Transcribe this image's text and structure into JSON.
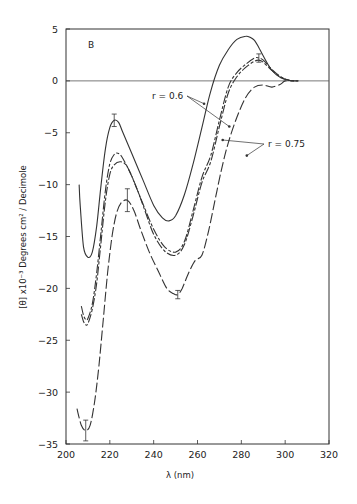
{
  "chart_data": {
    "type": "line",
    "panel_label": "B",
    "title": "",
    "xlabel": "λ (nm)",
    "ylabel": "[θ] x10⁻³ Degrees cm² / Decimole",
    "xlim": [
      200,
      320
    ],
    "ylim": [
      -35,
      5
    ],
    "x_ticks": [
      200,
      220,
      240,
      260,
      280,
      300,
      320
    ],
    "y_ticks": [
      5,
      0,
      -5,
      -10,
      -15,
      -20,
      -25,
      -30,
      -35
    ],
    "grid": false,
    "zero_line": true,
    "annotations": [
      {
        "text": "r = 0.6",
        "points_to": [
          "series_1",
          "series_2"
        ]
      },
      {
        "text": "r = 0.75",
        "points_to": [
          "series_3",
          "series_4"
        ]
      }
    ],
    "series": [
      {
        "name": "series_1",
        "style": "solid",
        "x": [
          206,
          206.5,
          208,
          210,
          212,
          214,
          216,
          218,
          220,
          222,
          224,
          226,
          230,
          235,
          240,
          244,
          247,
          250,
          254,
          258,
          262,
          266,
          270,
          274,
          278,
          282,
          284,
          286,
          288,
          290,
          294,
          298,
          302,
          305
        ],
        "values": [
          -10,
          -12,
          -16,
          -17,
          -16.5,
          -14,
          -10,
          -6.5,
          -4.5,
          -3.8,
          -4,
          -5,
          -7,
          -9.5,
          -12,
          -13.2,
          -13.5,
          -13,
          -11,
          -8,
          -4.5,
          -1,
          1.5,
          3,
          4,
          4.3,
          4.2,
          3.9,
          3.2,
          2.4,
          1,
          0.3,
          0.05,
          0
        ],
        "error_bars": [
          {
            "x": 222,
            "y": -3.8,
            "err": 0.6
          }
        ]
      },
      {
        "name": "series_2",
        "style": "long-short dash",
        "x": [
          207,
          208,
          209,
          210,
          212,
          214,
          216,
          218,
          220,
          222,
          224,
          226,
          230,
          235,
          240,
          245,
          250,
          254,
          258,
          262,
          266,
          270,
          274,
          278,
          282,
          286,
          288,
          290,
          294,
          298,
          302,
          306
        ],
        "values": [
          -21.7,
          -22.6,
          -23,
          -22.9,
          -21.5,
          -18.5,
          -14.5,
          -10.5,
          -8,
          -7.1,
          -7,
          -7.5,
          -9.2,
          -11.8,
          -14.3,
          -16,
          -16.5,
          -15.5,
          -12.5,
          -9.3,
          -7.2,
          -3.8,
          -0.6,
          0.8,
          1.6,
          2.2,
          2.2,
          2,
          1.1,
          0.4,
          0.05,
          0
        ]
      },
      {
        "name": "series_3",
        "style": "long-short dash",
        "x": [
          207,
          208,
          209,
          210,
          212,
          214,
          216,
          218,
          220,
          222,
          225,
          228,
          232,
          236,
          240,
          245,
          250,
          254,
          258,
          262,
          266,
          270,
          274,
          278,
          282,
          286,
          288,
          290,
          294,
          298,
          302,
          306
        ],
        "values": [
          -22.5,
          -23.2,
          -23.5,
          -23.4,
          -22,
          -19.5,
          -15.5,
          -11.5,
          -9,
          -8.1,
          -7.8,
          -8.3,
          -10.2,
          -12.5,
          -14.8,
          -16.4,
          -16.8,
          -15.8,
          -13,
          -9.8,
          -7.8,
          -4.4,
          -1.2,
          0.4,
          1.3,
          1.9,
          2,
          1.8,
          1.0,
          0.35,
          0.05,
          0
        ]
      },
      {
        "name": "series_4",
        "style": "long dash",
        "x": [
          205,
          207,
          209,
          211,
          213,
          215,
          217,
          219,
          221,
          223,
          225,
          228,
          231,
          234,
          238,
          242,
          246,
          249,
          251,
          253,
          256,
          259,
          262,
          265,
          268,
          271,
          274,
          278,
          282,
          286,
          290,
          294,
          298,
          300,
          304
        ],
        "values": [
          -31.6,
          -33.2,
          -33.7,
          -33.2,
          -31,
          -27.5,
          -23,
          -18.5,
          -15,
          -12.8,
          -11.8,
          -11.5,
          -12.5,
          -14.3,
          -16.5,
          -18.3,
          -20,
          -20.5,
          -20.6,
          -20,
          -18.5,
          -17.3,
          -16.8,
          -14.5,
          -11.5,
          -8.5,
          -6,
          -3.5,
          -1.6,
          -0.6,
          -0.4,
          -0.6,
          -0.3,
          0,
          0
        ],
        "error_bars": [
          {
            "x": 209,
            "y": -33.7,
            "err": 1.0
          },
          {
            "x": 228,
            "y": -11.5,
            "err": 1.1
          },
          {
            "x": 251,
            "y": -20.6,
            "err": 0.4
          },
          {
            "x": 288,
            "y": 2.2,
            "err": 0.4
          }
        ]
      }
    ]
  }
}
